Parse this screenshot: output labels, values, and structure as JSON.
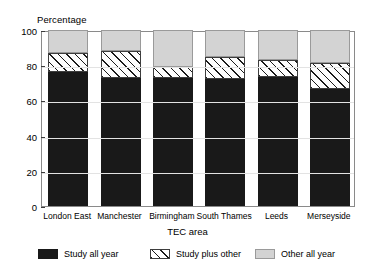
{
  "chart_data": {
    "type": "bar",
    "subtype": "stacked-vertical",
    "title": "",
    "xlabel": "TEC area",
    "ylabel": "Percentage",
    "ylim": [
      0,
      100
    ],
    "yticks": [
      0,
      20,
      40,
      60,
      80,
      100
    ],
    "ytick_labels": [
      "0",
      "20",
      "40",
      "60",
      "80",
      "100"
    ],
    "grid": false,
    "legend_position": "bottom",
    "categories": [
      "London East",
      "Manchester",
      "Birmingham",
      "South Thames",
      "Leeds",
      "Merseyside"
    ],
    "series": [
      {
        "name": "Study all year",
        "color": "#191919",
        "pattern": "solid",
        "values": [
          76,
          73,
          72.5,
          72,
          73.5,
          66.5
        ]
      },
      {
        "name": "Study plus other",
        "color": "#ffffff",
        "pattern": "diagonal-hatch",
        "values": [
          11,
          15,
          6.5,
          12.5,
          9.5,
          14.5
        ]
      },
      {
        "name": "Other all year",
        "color": "#d3d3d3",
        "pattern": "solid",
        "values": [
          13,
          12,
          21,
          15.5,
          17,
          19
        ]
      }
    ],
    "cumulative_tops": [
      [
        76,
        87,
        100
      ],
      [
        73,
        88,
        100
      ],
      [
        72.5,
        79,
        100
      ],
      [
        72,
        84.5,
        100
      ],
      [
        73.5,
        83,
        100
      ],
      [
        66.5,
        81,
        100
      ]
    ]
  },
  "legend": {
    "items": [
      {
        "label": "Study all year"
      },
      {
        "label": "Study plus other"
      },
      {
        "label": "Other all year"
      }
    ]
  }
}
